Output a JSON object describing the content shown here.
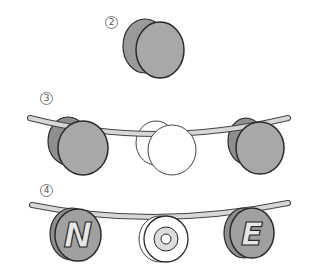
{
  "steps": [
    {
      "label": "2",
      "description": "two gray discs glued together"
    },
    {
      "label": "3",
      "description": "discs threaded onto a curved band"
    },
    {
      "label": "4",
      "description": "lettered discs on band"
    }
  ],
  "letters": [
    "N",
    "O",
    "E"
  ],
  "colors": {
    "disc_gray": "#a8a8a8",
    "disc_dark": "#8e8e8e",
    "band": "#d8d8d8",
    "outline": "#2a2a2a",
    "letter_fill": "#e6e6e6"
  }
}
